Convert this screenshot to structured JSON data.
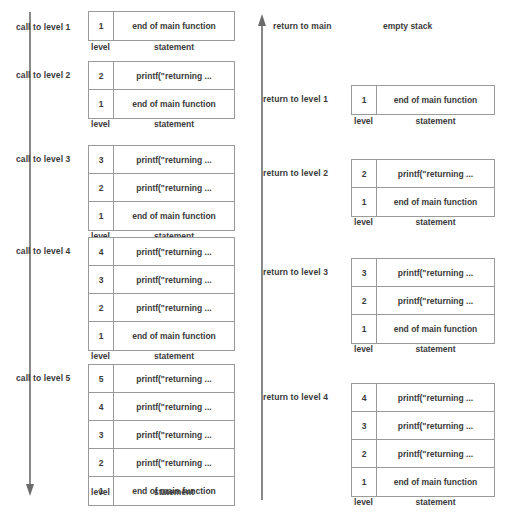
{
  "diagram": {
    "statement_main": "end of main function",
    "statement_printf": "printf(\"returning ...",
    "column_captions": {
      "level": "level",
      "statement": "statement"
    },
    "colors": {
      "box_border": "#9a9a9a",
      "text": "#3a3a3a",
      "arrow": "#6b6b6b",
      "background": "#ffffff"
    }
  },
  "left_column": {
    "arrow": {
      "direction": "down",
      "name": "calling-direction-arrow"
    },
    "phases": [
      {
        "label": "call to level 1",
        "frames": [
          {
            "level": "1",
            "statement": "end of main function"
          }
        ]
      },
      {
        "label": "call to level 2",
        "frames": [
          {
            "level": "2",
            "statement": "printf(\"returning ..."
          },
          {
            "level": "1",
            "statement": "end of main function"
          }
        ]
      },
      {
        "label": "call to level 3",
        "frames": [
          {
            "level": "3",
            "statement": "printf(\"returning ..."
          },
          {
            "level": "2",
            "statement": "printf(\"returning ..."
          },
          {
            "level": "1",
            "statement": "end of main function"
          }
        ]
      },
      {
        "label": "call to level 4",
        "frames": [
          {
            "level": "4",
            "statement": "printf(\"returning ..."
          },
          {
            "level": "3",
            "statement": "printf(\"returning ..."
          },
          {
            "level": "2",
            "statement": "printf(\"returning ..."
          },
          {
            "level": "1",
            "statement": "end of main function"
          }
        ]
      },
      {
        "label": "call to level 5",
        "frames": [
          {
            "level": "5",
            "statement": "printf(\"returning ..."
          },
          {
            "level": "4",
            "statement": "printf(\"returning ..."
          },
          {
            "level": "3",
            "statement": "printf(\"returning ..."
          },
          {
            "level": "2",
            "statement": "printf(\"returning ..."
          },
          {
            "level": "1",
            "statement": "end of main function"
          }
        ]
      }
    ]
  },
  "right_column": {
    "arrow": {
      "direction": "up",
      "name": "returning-direction-arrow"
    },
    "empty_phase": {
      "label": "return to main",
      "note": "empty stack"
    },
    "phases": [
      {
        "label": "return to level 1",
        "frames": [
          {
            "level": "1",
            "statement": "end of main function"
          }
        ]
      },
      {
        "label": "return to level 2",
        "frames": [
          {
            "level": "2",
            "statement": "printf(\"returning ..."
          },
          {
            "level": "1",
            "statement": "end of main function"
          }
        ]
      },
      {
        "label": "return to level 3",
        "frames": [
          {
            "level": "3",
            "statement": "printf(\"returning ..."
          },
          {
            "level": "2",
            "statement": "printf(\"returning ..."
          },
          {
            "level": "1",
            "statement": "end of main function"
          }
        ]
      },
      {
        "label": "return to level 4",
        "frames": [
          {
            "level": "4",
            "statement": "printf(\"returning ..."
          },
          {
            "level": "3",
            "statement": "printf(\"returning ..."
          },
          {
            "level": "2",
            "statement": "printf(\"returning ..."
          },
          {
            "level": "1",
            "statement": "end of main function"
          }
        ]
      }
    ]
  }
}
